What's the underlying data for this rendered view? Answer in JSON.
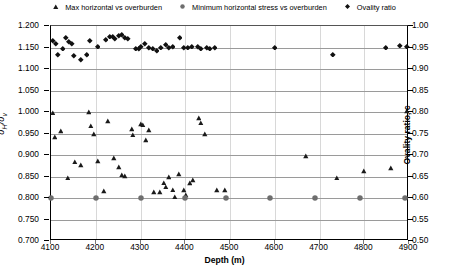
{
  "chart_data": {
    "type": "scatter",
    "title": "",
    "xlabel": "Depth (m)",
    "ylabel": "σH/σv",
    "ylabel_right": "Ovality ratio, c",
    "xlim": [
      4100,
      4900
    ],
    "ylim": [
      0.7,
      1.2
    ],
    "ylim_right": [
      0.5,
      1.0
    ],
    "xticks": [
      4100,
      4200,
      4300,
      4400,
      4500,
      4600,
      4700,
      4800,
      4900
    ],
    "yticks": [
      "0.700",
      "0.750",
      "0.800",
      "0.850",
      "0.900",
      "0.950",
      "1.000",
      "1.050",
      "1.100",
      "1.150",
      "1.200"
    ],
    "yticks_right": [
      "0.50",
      "0.55",
      "0.60",
      "0.65",
      "0.70",
      "0.75",
      "0.80",
      "0.85",
      "0.90",
      "0.95",
      "1.00"
    ],
    "grid": true,
    "legend_position": "top",
    "series": [
      {
        "name": "Max horizontal vs overburden",
        "marker": "triangle",
        "color": "#1a1a1a",
        "axis": "left",
        "points": [
          [
            4104,
            0.998
          ],
          [
            4108,
            0.941
          ],
          [
            4122,
            0.955
          ],
          [
            4137,
            0.847
          ],
          [
            4154,
            0.884
          ],
          [
            4167,
            0.876
          ],
          [
            4184,
            0.999
          ],
          [
            4190,
            0.968
          ],
          [
            4196,
            0.948
          ],
          [
            4206,
            0.886
          ],
          [
            4219,
            0.816
          ],
          [
            4228,
            0.978
          ],
          [
            4241,
            0.893
          ],
          [
            4252,
            0.872
          ],
          [
            4258,
            0.854
          ],
          [
            4266,
            0.851
          ],
          [
            4280,
            0.96
          ],
          [
            4284,
            0.947
          ],
          [
            4300,
            0.972
          ],
          [
            4306,
            0.97
          ],
          [
            4312,
            0.934
          ],
          [
            4320,
            0.958
          ],
          [
            4331,
            0.814
          ],
          [
            4344,
            0.814
          ],
          [
            4352,
            0.836
          ],
          [
            4357,
            0.826
          ],
          [
            4363,
            0.848
          ],
          [
            4372,
            0.819
          ],
          [
            4378,
            0.803
          ],
          [
            4386,
            0.856
          ],
          [
            4397,
            0.818
          ],
          [
            4402,
            0.806
          ],
          [
            4410,
            0.835
          ],
          [
            4418,
            0.841
          ],
          [
            4430,
            0.986
          ],
          [
            4436,
            0.975
          ],
          [
            4444,
            0.949
          ],
          [
            4471,
            0.818
          ],
          [
            4489,
            0.818
          ],
          [
            4670,
            0.897
          ],
          [
            4740,
            0.847
          ],
          [
            4800,
            0.862
          ],
          [
            4860,
            0.869
          ],
          [
            4896,
            1.002
          ]
        ]
      },
      {
        "name": "Minimum horizontal stress vs overburden",
        "marker": "circle",
        "color": "#6e6e6e",
        "axis": "left",
        "points": [
          [
            4100,
            0.8
          ],
          [
            4200,
            0.8
          ],
          [
            4300,
            0.8
          ],
          [
            4400,
            0.8
          ],
          [
            4490,
            0.8
          ],
          [
            4590,
            0.8
          ],
          [
            4690,
            0.8
          ],
          [
            4790,
            0.8
          ],
          [
            4890,
            0.8
          ]
        ]
      },
      {
        "name": "Ovality ratio",
        "marker": "diamond",
        "color": "#111111",
        "axis": "right",
        "points": [
          [
            4105,
            0.965
          ],
          [
            4112,
            0.958
          ],
          [
            4116,
            0.932
          ],
          [
            4126,
            0.947
          ],
          [
            4134,
            0.972
          ],
          [
            4140,
            0.962
          ],
          [
            4148,
            0.957
          ],
          [
            4152,
            0.93
          ],
          [
            4168,
            0.92
          ],
          [
            4180,
            0.932
          ],
          [
            4188,
            0.965
          ],
          [
            4204,
            0.952
          ],
          [
            4222,
            0.967
          ],
          [
            4232,
            0.975
          ],
          [
            4238,
            0.975
          ],
          [
            4244,
            0.969
          ],
          [
            4252,
            0.976
          ],
          [
            4258,
            0.978
          ],
          [
            4266,
            0.972
          ],
          [
            4272,
            0.969
          ],
          [
            4290,
            0.947
          ],
          [
            4296,
            0.946
          ],
          [
            4302,
            0.952
          ],
          [
            4310,
            0.958
          ],
          [
            4318,
            0.949
          ],
          [
            4328,
            0.947
          ],
          [
            4336,
            0.942
          ],
          [
            4346,
            0.95
          ],
          [
            4356,
            0.955
          ],
          [
            4364,
            0.948
          ],
          [
            4372,
            0.951
          ],
          [
            4388,
            0.971
          ],
          [
            4398,
            0.949
          ],
          [
            4406,
            0.95
          ],
          [
            4416,
            0.952
          ],
          [
            4428,
            0.951
          ],
          [
            4436,
            0.947
          ],
          [
            4448,
            0.949
          ],
          [
            4456,
            0.947
          ],
          [
            4466,
            0.948
          ],
          [
            4600,
            0.95
          ],
          [
            4730,
            0.933
          ],
          [
            4848,
            0.95
          ],
          [
            4880,
            0.954
          ],
          [
            4896,
            0.952
          ]
        ]
      }
    ]
  },
  "legend": {
    "items": [
      {
        "label": "Max horizontal vs overburden",
        "marker": "triangle"
      },
      {
        "label": "Minimum horizontal stress vs overburden",
        "marker": "circle"
      },
      {
        "label": "Ovality ratio",
        "marker": "diamond"
      }
    ]
  },
  "axes": {
    "x_title": "Depth (m)",
    "y_left_title_main": "σ",
    "y_left_title_sub1": "H",
    "y_left_title_mid": "/σ",
    "y_left_title_sub2": "v",
    "y_right_title": "Ovality ratio, c"
  }
}
